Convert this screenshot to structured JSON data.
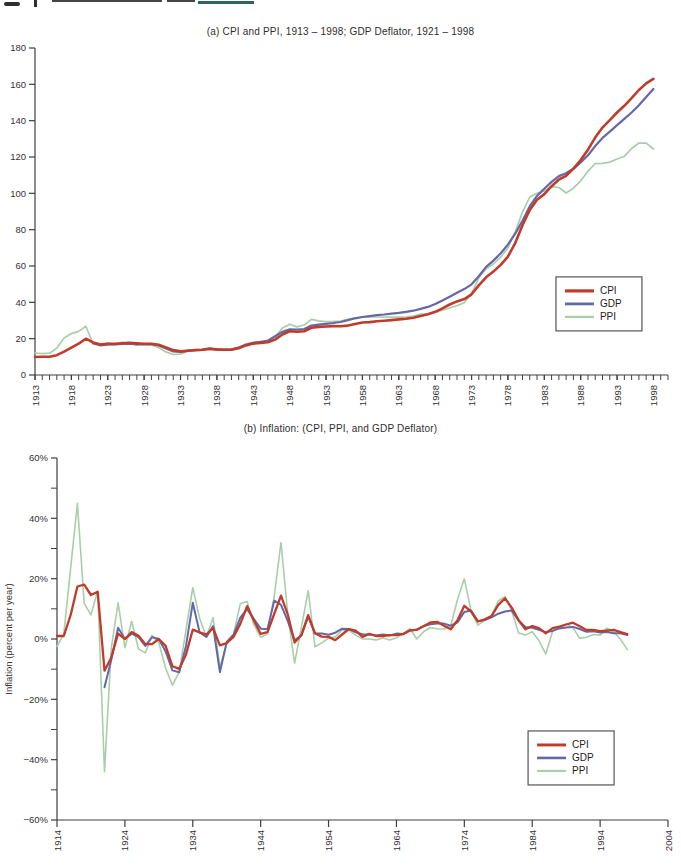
{
  "colors": {
    "cpi": "#c13b2a",
    "gdp": "#6468a8",
    "ppi": "#a8cfa8",
    "axis": "#3f3f3f",
    "text": "#333333",
    "legend_border": "#555555"
  },
  "chart_data": [
    {
      "type": "line",
      "panel": "a",
      "title": "(a) CPI and PPI, 1913 – 1998; GDP Deflator, 1921 – 1998",
      "xlabel": "",
      "ylabel": "",
      "xlim": [
        1913,
        2000
      ],
      "ylim": [
        0,
        180
      ],
      "yticks": [
        0,
        20,
        40,
        60,
        80,
        100,
        120,
        140,
        160,
        180
      ],
      "xticks": [
        1913,
        1918,
        1923,
        1928,
        1933,
        1938,
        1943,
        1948,
        1953,
        1958,
        1963,
        1968,
        1973,
        1978,
        1983,
        1988,
        1993,
        1998
      ],
      "x_minor_step": 1,
      "grid": false,
      "legend_pos": [
        0.823,
        0.7
      ],
      "legend_labels": [
        "CPI",
        "GDP",
        "PPI"
      ],
      "series": [
        {
          "name": "CPI",
          "color_key": "cpi",
          "x_start": 1913,
          "values": [
            9.9,
            10.0,
            10.1,
            10.9,
            12.8,
            15.1,
            17.3,
            20.0,
            17.9,
            16.8,
            17.1,
            17.1,
            17.5,
            17.7,
            17.4,
            17.1,
            17.1,
            16.7,
            15.2,
            13.7,
            13.0,
            13.4,
            13.7,
            13.9,
            14.4,
            14.1,
            13.9,
            14.0,
            14.7,
            16.3,
            17.3,
            17.6,
            18.0,
            19.5,
            22.3,
            24.1,
            23.8,
            24.1,
            26.0,
            26.5,
            26.7,
            26.9,
            26.8,
            27.2,
            28.1,
            28.9,
            29.1,
            29.6,
            29.9,
            30.2,
            30.6,
            31.0,
            31.5,
            32.4,
            33.4,
            34.8,
            36.7,
            38.8,
            40.5,
            41.8,
            44.4,
            49.3,
            53.8,
            56.9,
            60.6,
            65.2,
            72.6,
            82.4,
            90.9,
            96.5,
            99.6,
            103.9,
            107.6,
            109.6,
            113.6,
            118.3,
            124.0,
            130.7,
            136.2,
            140.3,
            144.5,
            148.2,
            152.4,
            156.9,
            160.5,
            163.0
          ]
        },
        {
          "name": "GDP",
          "color_key": "gdp",
          "x_start": 1921,
          "values": [
            17.5,
            16.3,
            16.9,
            16.9,
            17.2,
            17.3,
            16.9,
            17.0,
            17.0,
            16.3,
            14.6,
            13.0,
            12.7,
            13.4,
            13.7,
            13.8,
            14.4,
            14.0,
            13.9,
            14.1,
            15.1,
            16.6,
            17.7,
            18.3,
            18.9,
            21.3,
            23.7,
            25.1,
            25.0,
            25.3,
            27.2,
            27.7,
            28.2,
            28.6,
            29.2,
            30.2,
            31.2,
            31.9,
            32.4,
            32.9,
            33.3,
            33.8,
            34.2,
            34.8,
            35.4,
            36.4,
            37.5,
            39.1,
            41.0,
            43.1,
            45.3,
            47.3,
            49.9,
            54.4,
            59.5,
            63.0,
            67.0,
            71.8,
            77.8,
            84.9,
            92.9,
            98.6,
            102.5,
            106.3,
            109.5,
            111.0,
            113.5,
            117.0,
            121.0,
            126.0,
            130.5,
            134.0,
            137.5,
            141.0,
            144.5,
            148.5,
            153.0,
            157.5
          ]
        },
        {
          "name": "PPI",
          "color_key": "ppi",
          "x_start": 1913,
          "values": [
            12.1,
            11.8,
            12.0,
            14.8,
            20.4,
            22.8,
            24.0,
            26.8,
            16.9,
            16.8,
            17.5,
            17.0,
            18.0,
            17.4,
            16.6,
            16.8,
            16.6,
            15.0,
            12.7,
            11.3,
            11.5,
            13.1,
            14.0,
            14.1,
            15.1,
            13.7,
            13.5,
            13.7,
            15.3,
            17.2,
            18.0,
            18.1,
            18.4,
            21.0,
            25.8,
            27.9,
            26.5,
            27.5,
            30.6,
            29.8,
            29.4,
            29.5,
            29.7,
            30.6,
            31.5,
            31.9,
            31.9,
            31.9,
            31.8,
            31.9,
            31.8,
            31.9,
            32.5,
            33.6,
            33.6,
            34.4,
            35.7,
            36.9,
            38.1,
            39.8,
            45.0,
            53.5,
            58.4,
            61.1,
            64.9,
            69.9,
            78.7,
            89.8,
            98.0,
            100.0,
            101.3,
            103.7,
            103.2,
            100.2,
            102.8,
            106.9,
            112.2,
            116.3,
            116.5,
            117.2,
            118.9,
            120.4,
            124.7,
            127.7,
            127.6,
            124.4
          ]
        }
      ]
    },
    {
      "type": "line",
      "panel": "b",
      "title": "(b) Inflation: (CPI, PPI, and GDP Deflator)",
      "xlabel": "",
      "ylabel": "Inflation (percent per year)",
      "xlim": [
        1914,
        2004
      ],
      "ylim": [
        -60,
        60
      ],
      "yticks": [
        -60,
        -40,
        -20,
        0,
        20,
        40,
        60
      ],
      "y_minor_step": 10,
      "y_format": "percent",
      "xticks": [
        1914,
        1924,
        1934,
        1944,
        1954,
        1964,
        1974,
        1984,
        1994,
        2004
      ],
      "grid": false,
      "legend_pos": [
        0.771,
        0.754
      ],
      "legend_labels": [
        "CPI",
        "GDP",
        "PPI"
      ],
      "series": [
        {
          "name": "CPI",
          "color_key": "cpi",
          "x_start": 1914,
          "values": [
            1.0,
            1.0,
            7.9,
            17.4,
            18.0,
            14.6,
            15.6,
            -10.5,
            -6.1,
            1.8,
            0.0,
            2.3,
            1.1,
            -1.7,
            -1.7,
            0.0,
            -2.3,
            -9.0,
            -9.9,
            -5.1,
            3.1,
            2.2,
            1.5,
            3.6,
            -2.1,
            -1.4,
            0.7,
            5.0,
            10.9,
            6.1,
            1.7,
            2.3,
            8.3,
            14.4,
            8.1,
            -1.2,
            1.3,
            7.9,
            1.9,
            0.8,
            0.7,
            -0.4,
            1.5,
            3.3,
            2.8,
            0.7,
            1.7,
            1.0,
            1.0,
            1.3,
            1.3,
            1.6,
            2.9,
            3.1,
            4.2,
            5.5,
            5.7,
            4.4,
            3.2,
            6.2,
            11.0,
            9.1,
            5.8,
            6.5,
            7.6,
            11.3,
            13.5,
            10.3,
            6.2,
            3.2,
            4.3,
            3.6,
            1.9,
            3.6,
            4.1,
            4.8,
            5.4,
            4.2,
            3.0,
            3.0,
            2.6,
            2.8,
            3.0,
            2.3,
            1.6
          ]
        },
        {
          "name": "GDP",
          "color_key": "gdp",
          "x_start": 1921,
          "values": [
            -16.0,
            -6.9,
            3.7,
            0.0,
            1.8,
            0.6,
            -2.3,
            0.6,
            0.0,
            -4.1,
            -10.4,
            -11.0,
            -2.3,
            12.0,
            2.2,
            0.7,
            4.3,
            -11.0,
            -1.0,
            1.4,
            7.1,
            9.9,
            6.6,
            3.4,
            3.3,
            12.7,
            11.3,
            5.9,
            -0.4,
            1.2,
            7.5,
            1.8,
            1.8,
            1.4,
            2.1,
            3.4,
            3.3,
            2.2,
            1.6,
            1.5,
            1.2,
            1.5,
            1.2,
            1.8,
            1.7,
            2.8,
            3.0,
            4.3,
            4.9,
            5.1,
            5.1,
            4.4,
            5.5,
            9.0,
            9.4,
            5.9,
            6.3,
            7.2,
            8.4,
            9.1,
            9.4,
            6.1,
            4.0,
            3.7,
            3.0,
            2.3,
            2.7,
            3.5,
            3.8,
            4.0,
            3.3,
            2.4,
            2.6,
            2.2,
            2.3,
            1.9,
            1.9,
            1.3
          ]
        },
        {
          "name": "PPI",
          "color_key": "ppi",
          "x_start": 1914,
          "values": [
            -2.5,
            1.7,
            23.3,
            45.0,
            11.8,
            8.0,
            16.0,
            -44.0,
            -3.0,
            12.0,
            -2.9,
            5.9,
            -3.3,
            -4.6,
            1.2,
            -1.2,
            -9.6,
            -15.3,
            -11.0,
            3.0,
            17.0,
            6.9,
            0.7,
            7.1,
            -9.3,
            -1.5,
            1.5,
            11.7,
            12.4,
            4.7,
            0.6,
            1.7,
            14.1,
            32.0,
            8.1,
            -8.0,
            3.8,
            16.0,
            -2.6,
            -1.3,
            0.3,
            0.7,
            3.0,
            2.9,
            1.3,
            0.0,
            0.0,
            -0.3,
            0.3,
            -0.3,
            0.3,
            1.9,
            3.4,
            0.0,
            2.4,
            3.8,
            3.4,
            3.3,
            4.5,
            13.1,
            20.0,
            9.2,
            4.6,
            6.2,
            7.7,
            12.6,
            14.1,
            9.1,
            2.0,
            1.3,
            2.4,
            -0.5,
            -5.0,
            2.6,
            4.0,
            5.0,
            3.7,
            0.2,
            0.6,
            1.5,
            1.3,
            3.6,
            2.4,
            -0.1,
            -3.5
          ]
        }
      ]
    }
  ]
}
